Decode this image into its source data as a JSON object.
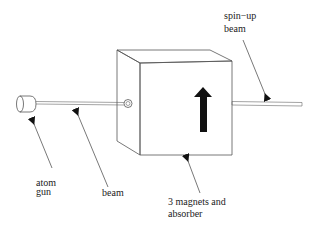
{
  "figure": {
    "type": "schematic",
    "box_arrow": "up"
  },
  "labels": {
    "atom_gun": [
      "atom",
      "gun"
    ],
    "beam": "beam",
    "magnets": [
      "3 magnets and",
      "absorber"
    ],
    "spin_up": [
      "spin−up",
      "beam"
    ]
  },
  "colors": {
    "line": "#555555",
    "arrow": "#111111",
    "background": "#ffffff"
  }
}
